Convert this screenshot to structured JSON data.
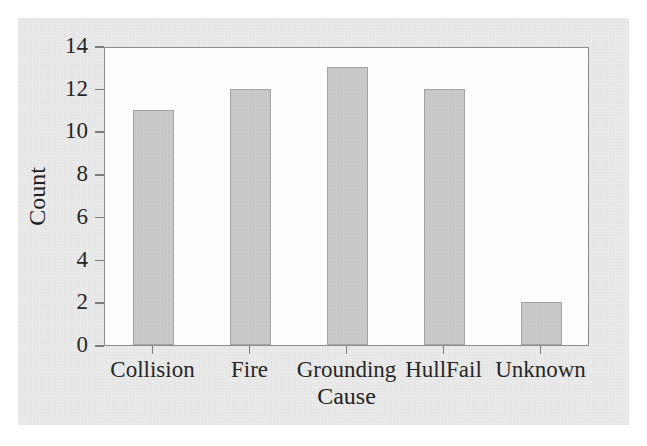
{
  "chart_data": {
    "type": "bar",
    "title": "",
    "xlabel": "Cause",
    "ylabel": "Count",
    "categories": [
      "Collision",
      "Fire",
      "Grounding",
      "HullFail",
      "Unknown"
    ],
    "values": [
      11,
      12,
      13,
      12,
      2
    ],
    "ylim": [
      0,
      14
    ],
    "ytick_labels": [
      "0",
      "2",
      "4",
      "6",
      "8",
      "10",
      "12",
      "14"
    ],
    "ytick_values": [
      0,
      2,
      4,
      6,
      8,
      10,
      12,
      14
    ],
    "grid": false,
    "legend": null,
    "bar_fill_color": "#c9c9c9",
    "bar_edge_color": "#a2a2a2",
    "panel_background": "#fdfdfd",
    "figure_background": "#e9e9e9",
    "axis_color": "#8d8d8d",
    "text_color": "#262626"
  }
}
